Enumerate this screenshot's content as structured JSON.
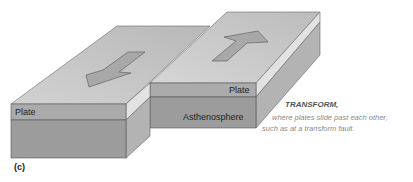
{
  "figure": {
    "panel_label": "(c)",
    "title": "TRANSFORM,",
    "caption_line1": "where plates slide past each other,",
    "caption_line2": "such as at a transform fault."
  },
  "labels": {
    "left_plate": "Plate",
    "right_plate": "Plate",
    "asthenosphere": "Asthenosphere"
  },
  "arrows": {
    "left_direction": "down-left",
    "right_direction": "up-right"
  },
  "colors": {
    "top_face": "#c4c4c4",
    "plate_front": "#a9a9a9",
    "asthenosphere_front": "#999999",
    "side_face": "#b6b6b6",
    "plate_side": "#dcdcdc",
    "arrow_fill": "#a8a8a8",
    "edge": "#555555"
  }
}
